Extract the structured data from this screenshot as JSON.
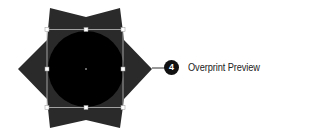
{
  "callout": {
    "number": "4",
    "label": "Overprint Preview"
  },
  "colors": {
    "star_fill": "#2a2a2a",
    "circle_fill": "#000000",
    "selection_stroke": "#bfbfbf",
    "handle_fill": "#ffffff",
    "badge_fill": "#111111",
    "text": "#222222"
  }
}
